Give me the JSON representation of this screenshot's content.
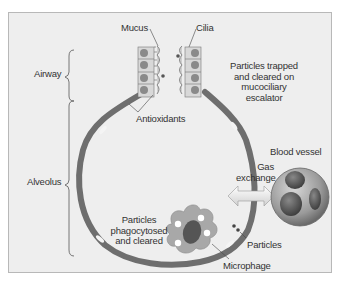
{
  "diagram": {
    "labels": {
      "mucus": "Mucus",
      "cilia": "Cilia",
      "airway": "Airway",
      "alveolus": "Alveolus",
      "antioxidants": "Antioxidants",
      "trapped_line1": "Particles trapped",
      "trapped_line2": "and cleared on",
      "trapped_line3": "mucociliary",
      "trapped_line4": "escalator",
      "blood_vessel": "Blood vessel",
      "gas_line1": "Gas",
      "gas_line2": "exchange",
      "phago_line1": "Particles",
      "phago_line2": "phagocytosed",
      "phago_line3": "and cleared",
      "particles": "Particles",
      "macrophage": "Microphage"
    },
    "colors": {
      "background": "#eeeeee",
      "wall": "#6e6e6e",
      "cell_nucleus": "#7a7a7a",
      "macrophage_body": "#a8a8a8",
      "blood_vessel": "#9a9a9a",
      "text": "#333333"
    }
  }
}
